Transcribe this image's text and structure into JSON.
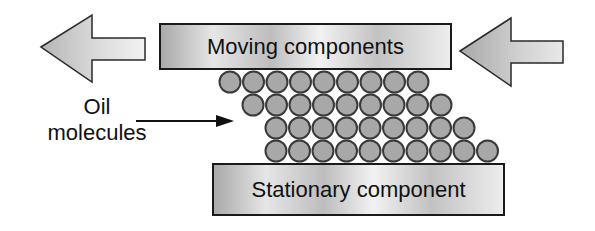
{
  "diagram": {
    "top_component": {
      "label": "Moving components"
    },
    "bottom_component": {
      "label": "Stationary component"
    },
    "callout": {
      "line1": "Oil",
      "line2": "molecules"
    },
    "arrows": [
      {
        "name": "left-arrow",
        "direction": "left",
        "meaning": "motion of moving components"
      },
      {
        "name": "right-arrow",
        "direction": "left",
        "meaning": "force applied on moving components"
      }
    ],
    "molecule_rows": [
      {
        "row": 1,
        "count": 9
      },
      {
        "row": 2,
        "count": 9
      },
      {
        "row": 3,
        "count": 9
      },
      {
        "row": 4,
        "count": 10
      }
    ],
    "colors": {
      "molecule_fill": "#a8a8a8",
      "molecule_stroke": "#3a3a3a",
      "arrow_fill": "#c8c8c8",
      "outline": "#1a1a1a"
    }
  }
}
